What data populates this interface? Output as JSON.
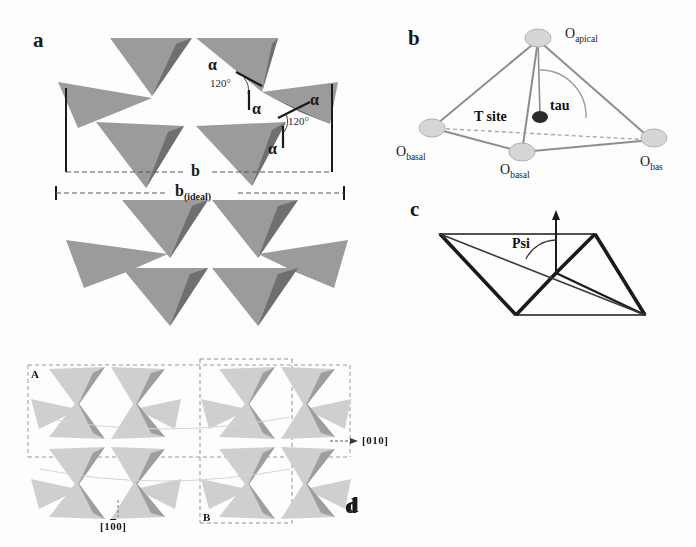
{
  "figure": {
    "background_color": "#fdfdfd",
    "ink_color": "#1a1a1a",
    "tetra_light_gray": "#9b9b9b",
    "tetra_dark_gray": "#6f6f6f",
    "tetra_pale_gray": "#c9c9c9",
    "tetra_pale_dark": "#a8a8a8"
  },
  "panels": {
    "a": {
      "letter": "a",
      "caption_angle_symbol_1": "α",
      "caption_angle_symbol_2": "α",
      "caption_angle_symbol_3": "α",
      "caption_angle_symbol_4": "α",
      "caption_angle_symbol_5": "α",
      "angle_value_1": "120°",
      "angle_value_2": "120°",
      "dimension_b_label": "b",
      "dimension_b_ideal_label": "b",
      "dimension_b_ideal_subscript": "(ideal)"
    },
    "b": {
      "letter": "b",
      "apical_label": "O",
      "apical_subscript": "apical",
      "basal_left_label": "O",
      "basal_left_subscript": "basal",
      "basal_bottom_label": "O",
      "basal_bottom_subscript": "basal",
      "basal_right_label": "O",
      "basal_right_subscript": "bas",
      "t_site_label": "T site",
      "tau_label": "tau"
    },
    "c": {
      "letter": "c",
      "psi_label": "Psi"
    },
    "d": {
      "letter": "d",
      "corner_a_label": "A",
      "corner_b_label": "B",
      "direction_010": "[010]",
      "direction_100_open": "[1",
      "direction_100_overline": "0",
      "direction_100_close": "0]"
    }
  }
}
